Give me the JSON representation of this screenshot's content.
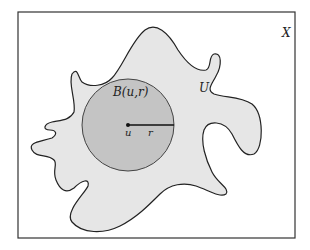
{
  "diagram": {
    "space_label": "X",
    "set_label": "U",
    "ball_label": "B(u,r)",
    "center_label": "u",
    "radius_label": "r"
  },
  "colors": {
    "background": "#ffffff",
    "frame": "#333333",
    "set_fill": "#e6e6e6",
    "ball_fill": "#c4c4c4",
    "outline": "#222222"
  }
}
